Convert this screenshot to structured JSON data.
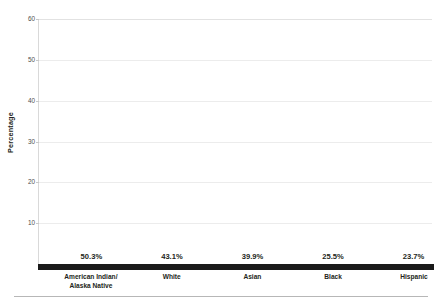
{
  "chart_data": {
    "type": "bar",
    "title": "",
    "subtitle": "",
    "xlabel": "",
    "ylabel": "Percentage",
    "ylim": [
      0,
      60
    ],
    "ytick_labels": [
      "60",
      "50",
      "40",
      "30",
      "20",
      "10"
    ],
    "yticks": [
      60,
      50,
      40,
      30,
      20,
      10
    ],
    "grid": true,
    "legend": false,
    "legend_position": "none",
    "categories": [
      "American Indian/\nAlaska Native",
      "White",
      "Asian",
      "Black",
      "Hispanic"
    ],
    "category_lines": [
      [
        "American Indian/",
        "Alaska Native"
      ],
      [
        "White"
      ],
      [
        "Asian"
      ],
      [
        "Black"
      ],
      [
        "Hispanic"
      ]
    ],
    "values": [
      50.3,
      43.1,
      39.9,
      25.5,
      23.7
    ],
    "value_labels": [
      "50.3%",
      "43.1%",
      "39.9%",
      "25.5%",
      "23.7%"
    ],
    "bar_color": "#717171",
    "baseline_color": "#1a1a1a",
    "gridline_color": "#ececec",
    "text_color": "#231f20",
    "tick_text_color": "#4d4d4d"
  }
}
